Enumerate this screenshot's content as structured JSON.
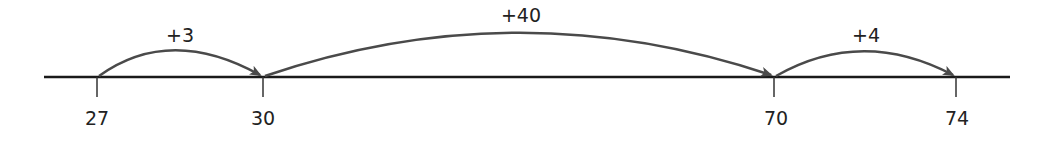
{
  "number_line": {
    "line": {
      "x1": 44,
      "x2": 1010,
      "y": 77,
      "color": "#1a1a1a"
    },
    "ticks": [
      {
        "value": "27",
        "x": 97
      },
      {
        "value": "30",
        "x": 263
      },
      {
        "value": "70",
        "x": 774
      },
      {
        "value": "74",
        "x": 956
      }
    ],
    "jumps": [
      {
        "label": "+3",
        "from": "27",
        "to": "30"
      },
      {
        "label": "+40",
        "from": "30",
        "to": "70"
      },
      {
        "label": "+4",
        "from": "70",
        "to": "74"
      }
    ],
    "arc_color": "#4a4a4a"
  }
}
